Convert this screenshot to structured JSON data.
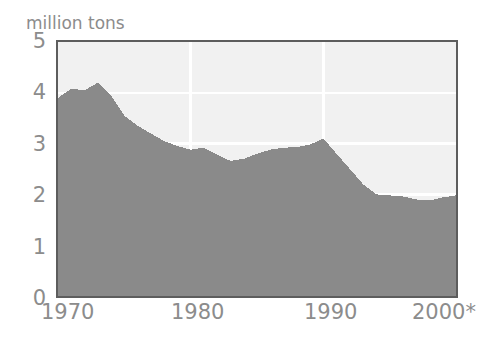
{
  "chart_data": {
    "type": "area",
    "title": "Northwest Atlantic",
    "subtitle": "",
    "xlabel": "",
    "ylabel": "million tons",
    "ylim": [
      0,
      5
    ],
    "xlim": [
      1970,
      2000
    ],
    "grid": true,
    "legend": false,
    "legend_position": "none",
    "y_ticks": [
      "5",
      "4",
      "3",
      "2",
      "1",
      "0"
    ],
    "y_tick_values": [
      5,
      4,
      3,
      2,
      1,
      0
    ],
    "x_ticks": [
      "1970",
      "1980",
      "1990",
      "2000*"
    ],
    "x_tick_values": [
      1970,
      1980,
      1990,
      2000
    ],
    "annotation": "* projected",
    "colors": {
      "area_fill": "#8a8a8a",
      "plot_background": "#f1f1f1",
      "frame": "#5d5d5d",
      "gridline": "#ffffff",
      "tick_label": "#8c8c8c",
      "title": "#6b6b6b"
    },
    "series": [
      {
        "name": "Northwest Atlantic catch",
        "units": "million tons",
        "x": [
          1970,
          1971,
          1972,
          1973,
          1974,
          1975,
          1976,
          1977,
          1978,
          1979,
          1980,
          1981,
          1982,
          1983,
          1984,
          1985,
          1986,
          1987,
          1988,
          1989,
          1990,
          1991,
          1992,
          1993,
          1994,
          1995,
          1996,
          1997,
          1998,
          1999,
          2000
        ],
        "values": [
          3.9,
          4.08,
          4.05,
          4.2,
          3.95,
          3.55,
          3.35,
          3.2,
          3.05,
          2.95,
          2.88,
          2.92,
          2.78,
          2.66,
          2.7,
          2.8,
          2.88,
          2.92,
          2.93,
          2.98,
          3.1,
          2.8,
          2.5,
          2.2,
          2.0,
          1.98,
          1.96,
          1.9,
          1.88,
          1.94,
          1.98
        ]
      }
    ]
  },
  "axis": {
    "y_caption": "million tons",
    "ticks_y": [
      {
        "label": "5"
      },
      {
        "label": "4"
      },
      {
        "label": "3"
      },
      {
        "label": "2"
      },
      {
        "label": "1"
      },
      {
        "label": "0"
      }
    ],
    "ticks_x": [
      {
        "label": "1970"
      },
      {
        "label": "1980"
      },
      {
        "label": "1990"
      },
      {
        "label": "2000*"
      }
    ]
  },
  "header": {
    "title": "Northwest Atlantic"
  }
}
